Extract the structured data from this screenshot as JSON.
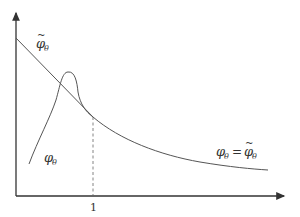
{
  "diagram": {
    "type": "function-plot",
    "colors": {
      "axis": "#333333",
      "curve": "#555555",
      "dashed": "#666666"
    },
    "axes": {
      "x_tick_label": "1"
    },
    "labels": {
      "phi_tilde": {
        "base": "φ",
        "sub": "θ",
        "accent": "~"
      },
      "phi": {
        "base": "φ",
        "sub": "θ"
      },
      "equality": {
        "lhs_base": "φ",
        "lhs_sub": "θ",
        "op": "=",
        "rhs_base": "φ",
        "rhs_sub": "θ",
        "rhs_accent": "~"
      }
    },
    "curves": [
      {
        "name": "phi-tilde-line",
        "description": "straight decreasing line from y-axis to x=1"
      },
      {
        "name": "phi-theta-curve",
        "description": "rising curve with a bump that meets the line at x=1"
      },
      {
        "name": "common-tail",
        "description": "decreasing convex tail for x>1 where the two coincide"
      }
    ]
  }
}
